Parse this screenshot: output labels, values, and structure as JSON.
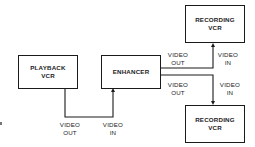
{
  "diagram": {
    "nodes": {
      "playback_vcr": {
        "label": "PLAYBACK\nVCR"
      },
      "enhancer": {
        "label": "ENHANCER"
      },
      "recording_vcr_top": {
        "label": "RECORDING\nVCR"
      },
      "recording_vcr_bottom": {
        "label": "RECORDING\nVCR"
      }
    },
    "labels": {
      "playback_out": "VIDEO\nOUT",
      "enhancer_in": "VIDEO\nIN",
      "enhancer_out_top": "VIDEO\nOUT",
      "recorder_top_in": "VIDEO\nIN",
      "enhancer_out_bottom": "VIDEO\nOUT",
      "recorder_bottom_in": "VIDEO\nIN"
    },
    "edges": [
      {
        "from": "playback_vcr",
        "to": "enhancer",
        "from_port": "VIDEO OUT",
        "to_port": "VIDEO IN"
      },
      {
        "from": "enhancer",
        "to": "recording_vcr_top",
        "from_port": "VIDEO OUT",
        "to_port": "VIDEO IN"
      },
      {
        "from": "enhancer",
        "to": "recording_vcr_bottom",
        "from_port": "VIDEO OUT",
        "to_port": "VIDEO IN"
      }
    ],
    "colors": {
      "line": "#1a1a1a",
      "text": "#222222",
      "background": "#ffffff"
    }
  }
}
